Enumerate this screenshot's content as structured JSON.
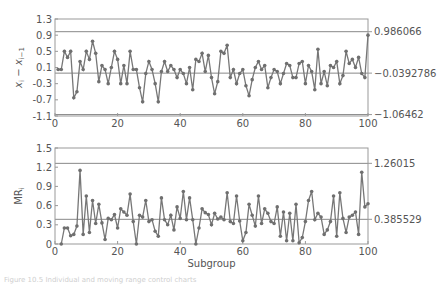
{
  "chart_data": [
    {
      "type": "line",
      "title": "",
      "ylabel": "x_i − x_{i−1}",
      "xlabel": "",
      "xlim": [
        0,
        100
      ],
      "ylim": [
        -1.1,
        1.3
      ],
      "yticks": [
        -1.1,
        -0.7,
        -0.3,
        0.1,
        0.5,
        0.9,
        1.3
      ],
      "ytick_labels": [
        "-1.1",
        "-0.7",
        "-0.3",
        "0.1",
        "0.5",
        "0.9",
        "1.3"
      ],
      "xticks": [
        0,
        20,
        40,
        60,
        80,
        100
      ],
      "xtick_labels": [
        "0",
        "20",
        "40",
        "60",
        "80",
        "100"
      ],
      "control_limits": {
        "ucl": 0.986066,
        "center": -0.0392786,
        "lcl": -1.06462,
        "ucl_label": "0.986066",
        "center_label": "−0.0392786",
        "lcl_label": "−1.06462"
      },
      "grid": false,
      "x": [
        1,
        2,
        3,
        4,
        5,
        6,
        7,
        8,
        9,
        10,
        11,
        12,
        13,
        14,
        15,
        16,
        17,
        18,
        19,
        20,
        21,
        22,
        23,
        24,
        25,
        26,
        27,
        28,
        29,
        30,
        31,
        32,
        33,
        34,
        35,
        36,
        37,
        38,
        39,
        40,
        41,
        42,
        43,
        44,
        45,
        46,
        47,
        48,
        49,
        50,
        51,
        52,
        53,
        54,
        55,
        56,
        57,
        58,
        59,
        60,
        61,
        62,
        63,
        64,
        65,
        66,
        67,
        68,
        69,
        70,
        71,
        72,
        73,
        74,
        75,
        76,
        77,
        78,
        79,
        80,
        81,
        82,
        83,
        84,
        85,
        86,
        87,
        88,
        89,
        90,
        91,
        92,
        93,
        94,
        95,
        96,
        97,
        98,
        99,
        100
      ],
      "values": [
        0.05,
        0.05,
        0.5,
        0.35,
        0.5,
        -0.65,
        -0.5,
        0.25,
        0.05,
        0.5,
        0.3,
        0.75,
        0.45,
        -0.25,
        0.15,
        0.05,
        -0.3,
        0.1,
        0.5,
        0.3,
        -0.3,
        0.15,
        -0.3,
        0.5,
        0.05,
        0.05,
        -0.4,
        -0.75,
        -0.05,
        0.25,
        0.05,
        -0.3,
        -0.75,
        0.0,
        0.25,
        0.0,
        0.15,
        0.05,
        -0.15,
        0.05,
        -0.05,
        -0.3,
        0.1,
        -0.45,
        0.3,
        0.25,
        0.45,
        0.0,
        0.4,
        -0.15,
        -0.55,
        -0.25,
        0.5,
        0.45,
        0.65,
        -0.15,
        0.05,
        -0.3,
        -0.05,
        0.05,
        -0.35,
        -0.6,
        -0.2,
        0.1,
        0.25,
        0.05,
        0.15,
        -0.4,
        -0.15,
        0.05,
        0.0,
        -0.3,
        -0.05,
        0.2,
        0.15,
        -0.15,
        -0.15,
        0.2,
        0.25,
        -0.3,
        0.15,
        0.0,
        -0.45,
        0.55,
        -0.3,
        0.0,
        -0.35,
        0.15,
        0.1,
        0.25,
        -0.3,
        -0.1,
        0.5,
        0.2,
        0.3,
        0.1,
        0.35,
        -0.05,
        -0.15,
        0.9,
        0.35,
        -0.25,
        0.35
      ],
      "series_color": "#777777"
    },
    {
      "type": "line",
      "title": "",
      "ylabel": "MR_i",
      "xlabel": "Subgroup",
      "xlim": [
        0,
        100
      ],
      "ylim": [
        0,
        1.5
      ],
      "yticks": [
        0,
        0.3,
        0.6,
        0.9,
        1.2,
        1.5
      ],
      "ytick_labels": [
        "0",
        "0.3",
        "0.6",
        "0.9",
        "1.2",
        "1.5"
      ],
      "xticks": [
        0,
        20,
        40,
        60,
        80,
        100
      ],
      "xtick_labels": [
        "0",
        "20",
        "40",
        "60",
        "80",
        "100"
      ],
      "control_limits": {
        "ucl": 1.26015,
        "center": 0.385529,
        "lcl": 0,
        "ucl_label": "1.26015",
        "center_label": "0.385529"
      },
      "grid": false,
      "x": [
        2,
        3,
        4,
        5,
        6,
        7,
        8,
        9,
        10,
        11,
        12,
        13,
        14,
        15,
        16,
        17,
        18,
        19,
        20,
        21,
        22,
        23,
        24,
        25,
        26,
        27,
        28,
        29,
        30,
        31,
        32,
        33,
        34,
        35,
        36,
        37,
        38,
        39,
        40,
        41,
        42,
        43,
        44,
        45,
        46,
        47,
        48,
        49,
        50,
        51,
        52,
        53,
        54,
        55,
        56,
        57,
        58,
        59,
        60,
        61,
        62,
        63,
        64,
        65,
        66,
        67,
        68,
        69,
        70,
        71,
        72,
        73,
        74,
        75,
        76,
        77,
        78,
        79,
        80,
        81,
        82,
        83,
        84,
        85,
        86,
        87,
        88,
        89,
        90,
        91,
        92,
        93,
        94,
        95,
        96,
        97,
        98,
        99,
        100
      ],
      "values": [
        0.0,
        0.25,
        0.25,
        0.13,
        0.15,
        0.28,
        1.15,
        0.15,
        0.75,
        0.18,
        0.68,
        0.32,
        0.62,
        0.33,
        0.07,
        0.4,
        0.38,
        0.46,
        0.25,
        0.55,
        0.5,
        0.45,
        0.78,
        0.35,
        0.0,
        0.45,
        0.42,
        0.68,
        0.35,
        0.38,
        0.2,
        0.12,
        0.72,
        0.38,
        0.3,
        0.45,
        0.22,
        0.58,
        0.4,
        0.82,
        0.38,
        0.72,
        0.38,
        0.0,
        0.25,
        0.55,
        0.49,
        0.46,
        0.3,
        0.48,
        0.39,
        0.42,
        0.38,
        0.8,
        0.35,
        0.32,
        0.75,
        0.36,
        0.05,
        0.18,
        0.62,
        0.45,
        0.28,
        0.75,
        0.32,
        0.55,
        0.48,
        0.35,
        0.32,
        0.58,
        0.12,
        0.5,
        0.05,
        0.48,
        0.05,
        0.62,
        0.02,
        0.1,
        0.35,
        0.68,
        0.82,
        0.38,
        0.48,
        0.42,
        0.15,
        0.22,
        0.35,
        0.75,
        0.12,
        0.8,
        0.4,
        0.18,
        0.42,
        0.45,
        0.5,
        0.15,
        1.12,
        0.58,
        0.63,
        0.6
      ],
      "series_color": "#777777"
    }
  ],
  "page": {
    "caption": "Figure 10.5 Individual and moving range control charts"
  }
}
